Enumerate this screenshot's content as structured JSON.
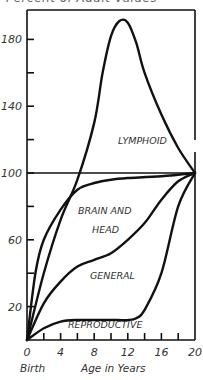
{
  "chart_data": {
    "type": "line",
    "title": "Percent of Adult Values",
    "xlabel": "Age in Years",
    "ylabel": "",
    "x_origin_label": "Birth",
    "xlim": [
      0,
      20
    ],
    "ylim": [
      0,
      200
    ],
    "x_ticks": [
      0,
      4,
      8,
      12,
      16,
      20
    ],
    "x_minor_ticks": [
      2,
      6,
      10,
      14,
      18
    ],
    "y_ticks": [
      20,
      60,
      100,
      140,
      180
    ],
    "y_minor_ticks": [
      40,
      80,
      120,
      160
    ],
    "reference_line": 100,
    "grid": false,
    "legend": "inline labels",
    "series": [
      {
        "name": "LYMPHOID",
        "x": [
          0,
          2,
          4,
          6,
          8,
          9,
          10,
          11,
          12,
          13,
          14,
          16,
          18,
          20
        ],
        "values": [
          0,
          40,
          72,
          96,
          130,
          160,
          182,
          191,
          190,
          178,
          160,
          135,
          115,
          100
        ]
      },
      {
        "name": "BRAIN AND HEAD",
        "x": [
          0,
          1,
          2,
          4,
          6,
          8,
          10,
          12,
          16,
          20
        ],
        "values": [
          0,
          40,
          60,
          78,
          90,
          94,
          96,
          97,
          98,
          100
        ]
      },
      {
        "name": "GENERAL",
        "x": [
          0,
          2,
          4,
          6,
          8,
          10,
          12,
          14,
          16,
          18,
          20
        ],
        "values": [
          0,
          22,
          35,
          44,
          48,
          52,
          60,
          70,
          84,
          95,
          100
        ]
      },
      {
        "name": "REPRODUCTIVE",
        "x": [
          0,
          2,
          4,
          6,
          8,
          10,
          12,
          13,
          14,
          16,
          18,
          20
        ],
        "values": [
          0,
          7,
          11,
          12,
          12,
          12,
          12,
          13,
          18,
          40,
          80,
          100
        ]
      }
    ]
  },
  "labels": {
    "title": "Percent of Adult Values",
    "lymphoid": "LYMPHOID",
    "brain_line1": "BRAIN AND",
    "brain_line2": "HEAD",
    "general": "GENERAL",
    "reproductive": "REPRODUCTIVE",
    "xlabel": "Age in Years",
    "birth": "Birth",
    "y_tick_labels": [
      "20",
      "60",
      "100",
      "140",
      "180"
    ],
    "x_tick_labels": [
      "0",
      "4",
      "8",
      "12",
      "16",
      "20"
    ]
  }
}
